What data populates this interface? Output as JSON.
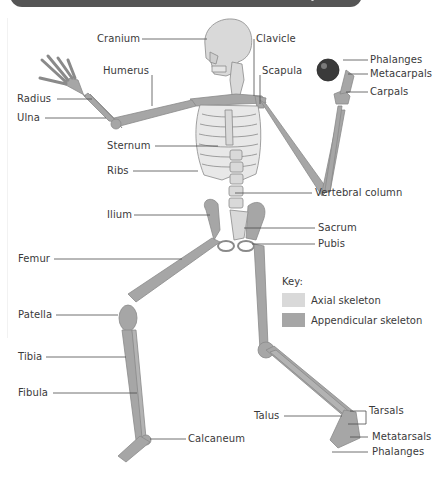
{
  "banner": {
    "color": "#555555"
  },
  "colors": {
    "axial": "#d9d9d9",
    "appendicular": "#a6a6a6",
    "outline": "#8a8a8a",
    "leader": "#4d4d4d",
    "ball": "#3a3a3a"
  },
  "labels": {
    "cranium": "Cranium",
    "clavicle": "Clavicle",
    "humerus": "Humerus",
    "scapula": "Scapula",
    "radius": "Radius",
    "ulna": "Ulna",
    "phalanges_hand": "Phalanges",
    "metacarpals": "Metacarpals",
    "carpals": "Carpals",
    "sternum": "Sternum",
    "ribs": "Ribs",
    "vertebral_column": "Vertebral column",
    "ilium": "Ilium",
    "sacrum": "Sacrum",
    "pubis": "Pubis",
    "femur": "Femur",
    "patella": "Patella",
    "tibia": "Tibia",
    "fibula": "Fibula",
    "talus": "Talus",
    "tarsals": "Tarsals",
    "metatarsals": "Metatarsals",
    "phalanges_foot": "Phalanges",
    "calcaneum": "Calcaneum"
  },
  "key": {
    "title": "Key:",
    "items": [
      {
        "label": "Axial skeleton",
        "color": "#d9d9d9"
      },
      {
        "label": "Appendicular skeleton",
        "color": "#a6a6a6"
      }
    ]
  }
}
